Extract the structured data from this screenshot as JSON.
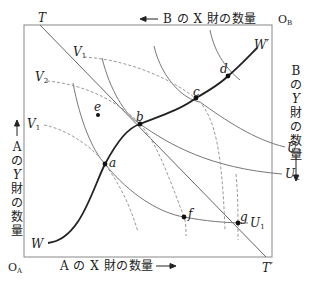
{
  "diagram": {
    "type": "edgeworth-box",
    "origins": {
      "a": "O",
      "a_sub": "A",
      "b": "O",
      "b_sub": "B"
    },
    "axes": {
      "bottom": "A の X 財の数量",
      "top": "B の X 財の数量",
      "left": [
        "A",
        "の",
        "Y",
        "財",
        "の",
        "数",
        "量"
      ],
      "right": [
        "B",
        "の",
        "Y",
        "財",
        "の",
        "数",
        "量"
      ]
    },
    "price_line": {
      "start": "T",
      "end": "T′"
    },
    "contract_curve": {
      "start": "W",
      "end": "W′"
    },
    "indifference_curves_A": [
      {
        "name": "U",
        "sub": "1"
      },
      {
        "name": "U",
        "sub": "2"
      },
      {
        "name": "U",
        "sub": "3"
      }
    ],
    "indifference_curves_B": [
      {
        "name": "V",
        "sub": "1",
        "position": "top"
      },
      {
        "name": "V",
        "sub": "2",
        "position": "middle"
      },
      {
        "name": "V",
        "sub": "1",
        "position": "lower-left"
      }
    ],
    "points": [
      {
        "label": "a",
        "x": 105,
        "y": 164
      },
      {
        "label": "b",
        "x": 140,
        "y": 124
      },
      {
        "label": "c",
        "x": 196,
        "y": 98
      },
      {
        "label": "d",
        "x": 228,
        "y": 76
      },
      {
        "label": "e",
        "x": 98,
        "y": 115
      },
      {
        "label": "f",
        "x": 184,
        "y": 217
      },
      {
        "label": "g",
        "x": 238,
        "y": 223
      }
    ]
  }
}
